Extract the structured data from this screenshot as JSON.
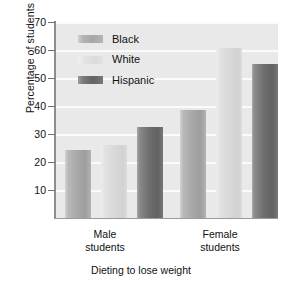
{
  "chart_data": {
    "type": "bar",
    "title": "",
    "xlabel": "Dieting to lose weight",
    "ylabel": "Percentage of students",
    "categories": [
      "Male students",
      "Female students"
    ],
    "series": [
      {
        "name": "Black",
        "values": [
          25.0,
          39.5
        ],
        "color": "#a9a9a9"
      },
      {
        "name": "White",
        "values": [
          27.0,
          62.5
        ],
        "color": "#d8d8d8"
      },
      {
        "name": "Hispanic",
        "values": [
          33.5,
          56.5
        ],
        "color": "#6f6f6f"
      }
    ],
    "ylim": [
      0,
      72
    ],
    "yticks": [
      10,
      20,
      30,
      40,
      50,
      60,
      70
    ],
    "ytick_labels": [
      "10",
      "20",
      "30",
      "40",
      "50",
      "60",
      "70"
    ],
    "grid": "horizontal",
    "legend_position": "upper-left-inside",
    "plot_background": "#e9e9e9",
    "gridline_color": "#fbfbfb"
  },
  "axis": {
    "y_title": "Percentage of students",
    "x_title": "Dieting to lose weight",
    "ticks": [
      {
        "label": "70",
        "value": 70
      },
      {
        "label": "60",
        "value": 60
      },
      {
        "label": "50",
        "value": 50
      },
      {
        "label": "40",
        "value": 40
      },
      {
        "label": "30",
        "value": 30
      },
      {
        "label": "20",
        "value": 20
      },
      {
        "label": "10",
        "value": 10
      }
    ]
  },
  "legend": {
    "items": [
      {
        "label": "Black"
      },
      {
        "label": "White"
      },
      {
        "label": "Hispanic"
      }
    ]
  },
  "groups": [
    {
      "line1": "Male",
      "line2": "students"
    },
    {
      "line1": "Female",
      "line2": "students"
    }
  ]
}
